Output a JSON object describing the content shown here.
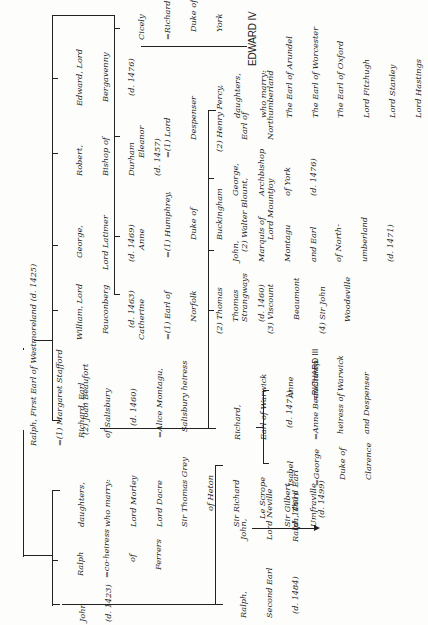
{
  "orientation": "rotated 90 degrees counter-clockwise",
  "root": {
    "name": "Ralph, First Earl of Westmoreland (d. 1425)",
    "spouses": [
      "=(1) Margaret Stafford",
      "(2) Joan Beaufort"
    ]
  },
  "gen1_first_marriage": [
    {
      "id": "john",
      "lines": [
        "John",
        "(d. 1423)"
      ]
    },
    {
      "id": "ralph",
      "lines": [
        "Ralph",
        "=co-heiress",
        "of",
        "Ferrers"
      ]
    },
    {
      "id": "daughters1",
      "lines": [
        "daughters,",
        "who marry:",
        "Lord Morley",
        "Lord Dacre",
        "Sir Thomas Grey",
        "of Heton",
        "Sir Richard",
        "Le Scrope",
        "Sir Gilbert",
        "Umfraville"
      ]
    }
  ],
  "gen1_second_marriage": [
    {
      "id": "richard-salisbury",
      "lines": [
        "Richard, Earl",
        "of Salisbury",
        "(d. 1460)",
        "=Alice Montagu,",
        "Salisbury heiress"
      ]
    },
    {
      "id": "william",
      "lines": [
        "William, Lord",
        "Fauconberg",
        "(d. 1463)"
      ]
    },
    {
      "id": "george-latimer",
      "lines": [
        "George,",
        "Lord Latimer",
        "(d. 1469)"
      ]
    },
    {
      "id": "robert",
      "lines": [
        "Robert,",
        "Bishop of",
        "Durham",
        "(d. 1457)"
      ]
    },
    {
      "id": "edward",
      "lines": [
        "Edward, Lord",
        "Bergavenny",
        "(d. 1476)"
      ]
    },
    {
      "id": "catherine",
      "lines": [
        "Catherine",
        "=(1) Earl of",
        "Norfolk",
        "(2) Thomas",
        "Strangways",
        "(3) Viscount",
        "Beaumont",
        "(4) Sir John",
        "Woodeville"
      ]
    },
    {
      "id": "anne",
      "lines": [
        "Anne",
        "=(1) Humphrey,",
        "Duke of",
        "Buckingham",
        "(2) Walter Blount,",
        "Lord Mountjoy"
      ]
    },
    {
      "id": "eleanor",
      "lines": [
        "Eleanor",
        "=(1) Lord",
        "Despenser",
        "(2) Henry Percy,",
        "Earl of",
        "Northumberland"
      ]
    },
    {
      "id": "cicely",
      "lines": [
        "Cicely",
        "=Richard,",
        "Duke of",
        "York"
      ]
    }
  ],
  "gen2_john_line": [
    {
      "id": "ralph-second",
      "lines": [
        "Ralph,",
        "Second Earl",
        "(d. 1484)"
      ]
    },
    {
      "id": "john-neville",
      "lines": [
        "John,",
        "Lord Neville",
        "(d. 1461)"
      ]
    }
  ],
  "gen3_john_line": {
    "id": "ralph-third",
    "lines": [
      "Ralph, Third Earl",
      "(d. 1499)"
    ]
  },
  "gen2_salisbury": [
    {
      "id": "richard-warwick",
      "lines": [
        "Richard,",
        "Earl of Warwick",
        "(d. 1471)",
        "=Anne Beauchamp",
        "heiress of Warwick",
        "and Despenser"
      ]
    },
    {
      "id": "thomas",
      "lines": [
        "Thomas",
        "(d. 1460)"
      ]
    },
    {
      "id": "john-montagu",
      "lines": [
        "John,",
        "Marquis of",
        "Montagu",
        "and Earl",
        "of North-",
        "umberland",
        "(d. 1471)"
      ]
    },
    {
      "id": "george-york",
      "lines": [
        "George,",
        "Archbishop",
        "of York",
        "(d. 1476)"
      ]
    },
    {
      "id": "daughters2",
      "lines": [
        "daughters,",
        "who marry:",
        "The Earl of Arundel",
        "The Earl of Worcester",
        "The Earl of Oxford",
        "Lord Fitzhugh",
        "Lord Stanley",
        "Lord Hastings"
      ]
    }
  ],
  "gen3_warwick": [
    {
      "id": "isabel",
      "lines": [
        "Isabel",
        "=George",
        "Duke of",
        "Clarence"
      ]
    },
    {
      "id": "anne-warwick",
      "lines": [
        "Anne",
        "=RICHARD III"
      ]
    }
  ],
  "york_child": {
    "id": "edward-iv",
    "label": "EDWARD IV"
  }
}
